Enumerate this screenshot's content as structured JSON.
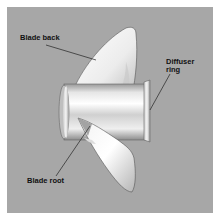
{
  "diagram": {
    "background_color": "#a7a7a7",
    "labels": {
      "blade_back": "Blade back",
      "diffuser_ring_line1": "Diffuser",
      "diffuser_ring_line2": "ring",
      "blade_root": "Blade root"
    },
    "parts": [
      "upper-blade",
      "hub",
      "diffuser-ring",
      "lower-blade"
    ]
  }
}
